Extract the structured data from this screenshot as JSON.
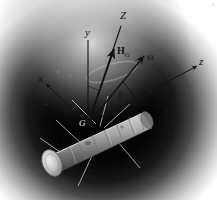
{
  "figure": {
    "background_color": "#ffffff",
    "space_color": "#000000",
    "glow_color": "#d8d8d8",
    "line_color": "#111111",
    "corner_mark": "c"
  },
  "labels": {
    "axis_Z": "Z",
    "axis_y": "y",
    "axis_x": "x",
    "axis_z": "z",
    "vector_H": "H",
    "vector_H_sub": "G",
    "vector_omega": "ω",
    "angle_theta": "θ",
    "point_G": "G"
  },
  "vectors": {
    "Z": {
      "label": "Z",
      "from": [
        88,
        124
      ],
      "to": [
        121,
        26
      ],
      "arrow": false
    },
    "y": {
      "label": "y",
      "from": [
        88,
        124
      ],
      "to": [
        88,
        40
      ],
      "arrow": false
    },
    "x": {
      "label": "x",
      "from": [
        88,
        124
      ],
      "to": [
        44,
        82
      ],
      "arrow": true
    },
    "z": {
      "label": "z",
      "from": [
        88,
        124
      ],
      "to": [
        199,
        65
      ],
      "arrow": true
    },
    "H_G": {
      "label": "H_G",
      "from": [
        88,
        124
      ],
      "to": [
        113,
        47
      ],
      "arrow": true
    },
    "omega": {
      "label": "ω",
      "from": [
        88,
        124
      ],
      "to": [
        146,
        54
      ],
      "arrow": true
    }
  },
  "annotations": {
    "theta_arc": "angle between z body axis and omega",
    "spin_ellipse": "precession cone trace about Z"
  },
  "body": {
    "shape": "cylinder",
    "description": "cylindrical spacecraft body with banded surface and antennas",
    "axis_from": [
      52,
      160
    ],
    "axis_to": [
      152,
      112
    ]
  }
}
